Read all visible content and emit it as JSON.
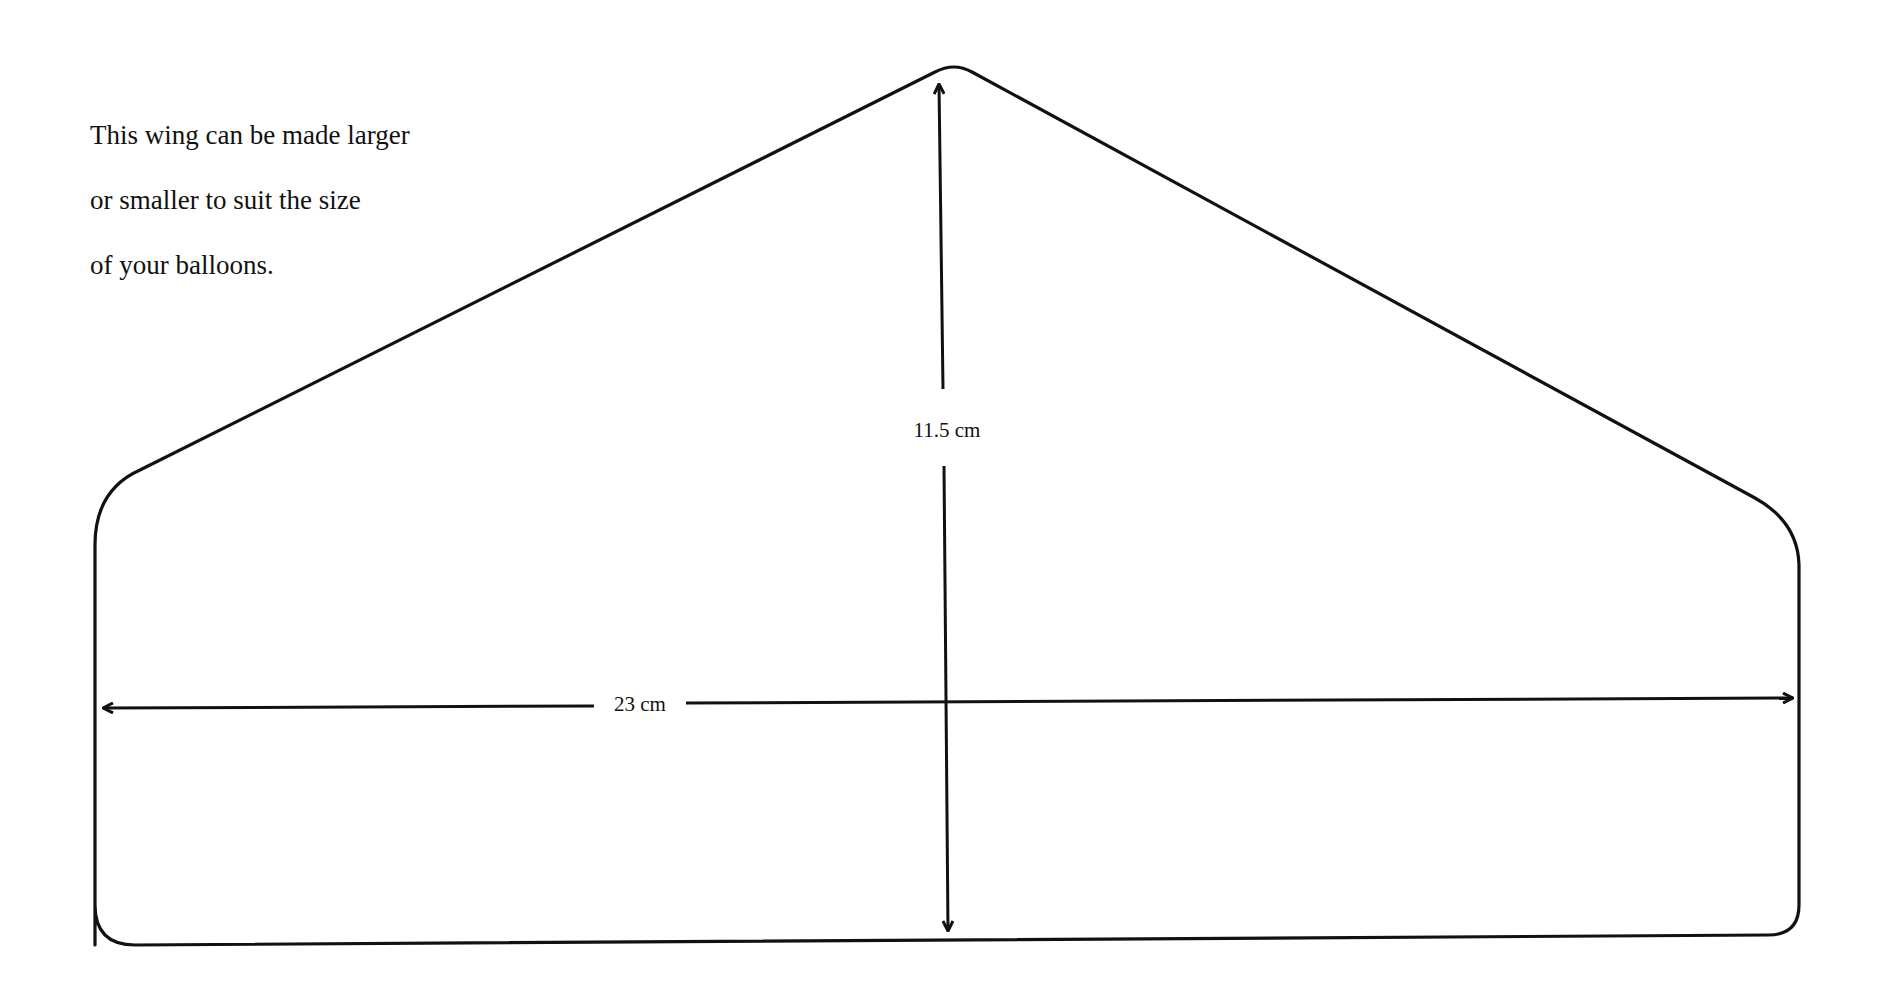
{
  "note": {
    "lines": [
      "This wing can be made larger",
      "or smaller to suit the size",
      "of your balloons."
    ]
  },
  "dimensions": {
    "height_label": "11.5 cm",
    "width_label": "23 cm"
  },
  "diagram": {
    "shape": "wing-template",
    "stroke_color": "#111111",
    "background": "#ffffff"
  }
}
